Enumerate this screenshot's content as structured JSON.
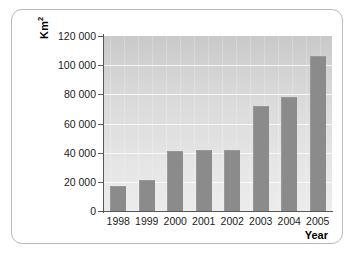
{
  "chart_data": {
    "type": "bar",
    "title": "",
    "subtitle": "",
    "xlabel": "Year",
    "ylabel": "Km²",
    "ylabel_base": "Km",
    "ylabel_exponent": "2",
    "categories": [
      "1998",
      "1999",
      "2000",
      "2001",
      "2002",
      "2003",
      "2004",
      "2005"
    ],
    "values": [
      17000,
      21000,
      41000,
      41500,
      42000,
      72000,
      78000,
      106000
    ],
    "series": [
      {
        "name": "Area",
        "values": [
          17000,
          21000,
          41000,
          41500,
          42000,
          72000,
          78000,
          106000
        ]
      }
    ],
    "ylim": [
      0,
      120000
    ],
    "ytick_values": [
      0,
      20000,
      40000,
      60000,
      80000,
      100000,
      120000
    ],
    "ytick_labels": [
      "0",
      "20 000",
      "40 000",
      "60 000",
      "80 000",
      "100 000",
      "120 000"
    ],
    "grid": true,
    "grid_axis": "y",
    "legend": false,
    "legend_position": "none",
    "bar_color": "#8b8b8b",
    "plot_background": "#dcdcdc",
    "axis_color": "#58585a",
    "text_color": "#1c1c1c",
    "frame_border_color": "#b9b9b9"
  }
}
